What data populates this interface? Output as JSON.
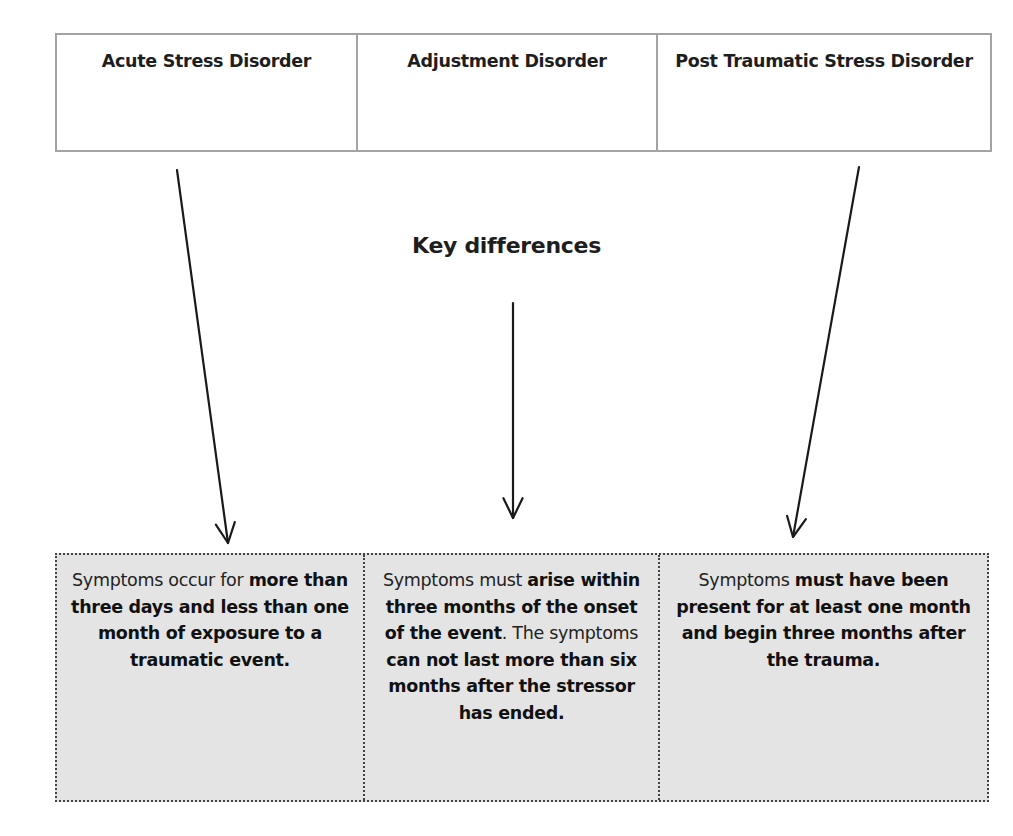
{
  "diagram": {
    "title": "Key differences",
    "disorders": [
      {
        "name": "Acute Stress Disorder"
      },
      {
        "name": "Adjustment Disorder"
      },
      {
        "name": "Post Traumatic Stress Disorder"
      }
    ],
    "descriptions": [
      {
        "segments": [
          {
            "text": "Symptoms occur for ",
            "bold": false
          },
          {
            "text": "more than three days and less than one month of exposure to a traumatic event.",
            "bold": true
          }
        ]
      },
      {
        "segments": [
          {
            "text": "Symptoms must ",
            "bold": false
          },
          {
            "text": "arise within three months of the onset of the event",
            "bold": true
          },
          {
            "text": ". The symptoms ",
            "bold": false
          },
          {
            "text": "can not last more than six months after the stressor has ended.",
            "bold": true
          }
        ]
      },
      {
        "segments": [
          {
            "text": "Symptoms ",
            "bold": false
          },
          {
            "text": "must have been present for at least one month and begin three months after the trauma.",
            "bold": true
          }
        ]
      }
    ],
    "arrows": [
      {
        "from": "acute-stress-disorder-box",
        "to": "acute-stress-description",
        "x1": 177,
        "y1": 170,
        "x2": 228,
        "y2": 543
      },
      {
        "from": "key-differences-title",
        "to": "adjustment-description",
        "x1": 513,
        "y1": 303,
        "x2": 513,
        "y2": 518
      },
      {
        "from": "ptsd-box",
        "to": "ptsd-description",
        "x1": 859,
        "y1": 167,
        "x2": 793,
        "y2": 537
      }
    ],
    "colors": {
      "top_border": "#a3a3a3",
      "bottom_fill": "#e4e4e4",
      "text": "#1e1e1e"
    }
  }
}
